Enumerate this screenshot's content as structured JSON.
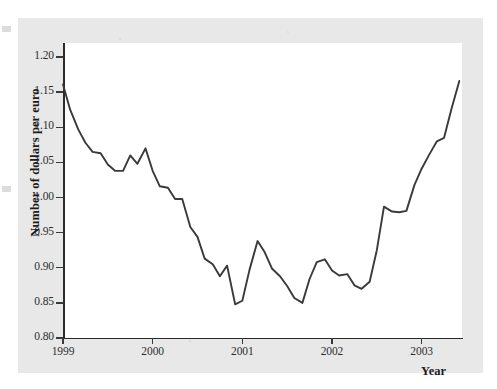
{
  "figure": {
    "y_axis_title": "Number of dollars per euro",
    "x_axis_title": "Year",
    "line_color": "#3a3a3a",
    "panel_color": "#e8e8e8",
    "plot_background": "#ffffff",
    "axis_color": "#2b2b2b"
  },
  "chart_data": {
    "type": "line",
    "title": "",
    "xlabel": "Year",
    "ylabel": "Number of dollars per euro",
    "xlim": [
      1999.0,
      2003.45
    ],
    "ylim": [
      0.8,
      1.22
    ],
    "xticks": [
      1999,
      2000,
      2001,
      2002,
      2003
    ],
    "xtick_labels": [
      "1999",
      "2000",
      "2001",
      "2002",
      "2003"
    ],
    "yticks": [
      0.8,
      0.85,
      0.9,
      0.95,
      1.0,
      1.05,
      1.1,
      1.15,
      1.2
    ],
    "ytick_labels": [
      "0.80",
      "0.85",
      "0.90",
      "0.95",
      "1.00",
      "1.05",
      "1.10",
      "1.15",
      "1.20"
    ],
    "grid": false,
    "legend": false,
    "series": [
      {
        "name": "Dollars per euro",
        "x": [
          1999.0,
          1999.08,
          1999.17,
          1999.25,
          1999.33,
          1999.42,
          1999.5,
          1999.58,
          1999.67,
          1999.75,
          1999.83,
          1999.92,
          2000.0,
          2000.08,
          2000.17,
          2000.25,
          2000.33,
          2000.42,
          2000.5,
          2000.58,
          2000.67,
          2000.75,
          2000.83,
          2000.92,
          2001.0,
          2001.08,
          2001.17,
          2001.25,
          2001.33,
          2001.42,
          2001.5,
          2001.58,
          2001.67,
          2001.75,
          2001.83,
          2001.92,
          2002.0,
          2002.08,
          2002.17,
          2002.25,
          2002.33,
          2002.42,
          2002.5,
          2002.58,
          2002.67,
          2002.75,
          2002.83,
          2002.92,
          2003.0,
          2003.08,
          2003.17,
          2003.25,
          2003.33,
          2003.42
        ],
        "y": [
          1.161,
          1.125,
          1.097,
          1.078,
          1.065,
          1.063,
          1.047,
          1.038,
          1.038,
          1.06,
          1.048,
          1.07,
          1.038,
          1.016,
          1.014,
          0.998,
          0.998,
          0.958,
          0.944,
          0.913,
          0.905,
          0.888,
          0.903,
          0.848,
          0.853,
          0.897,
          0.938,
          0.922,
          0.899,
          0.888,
          0.874,
          0.857,
          0.85,
          0.884,
          0.908,
          0.912,
          0.896,
          0.889,
          0.891,
          0.875,
          0.87,
          0.88,
          0.925,
          0.987,
          0.98,
          0.979,
          0.981,
          1.018,
          1.041,
          1.06,
          1.08,
          1.085,
          1.125,
          1.166
        ]
      }
    ]
  }
}
